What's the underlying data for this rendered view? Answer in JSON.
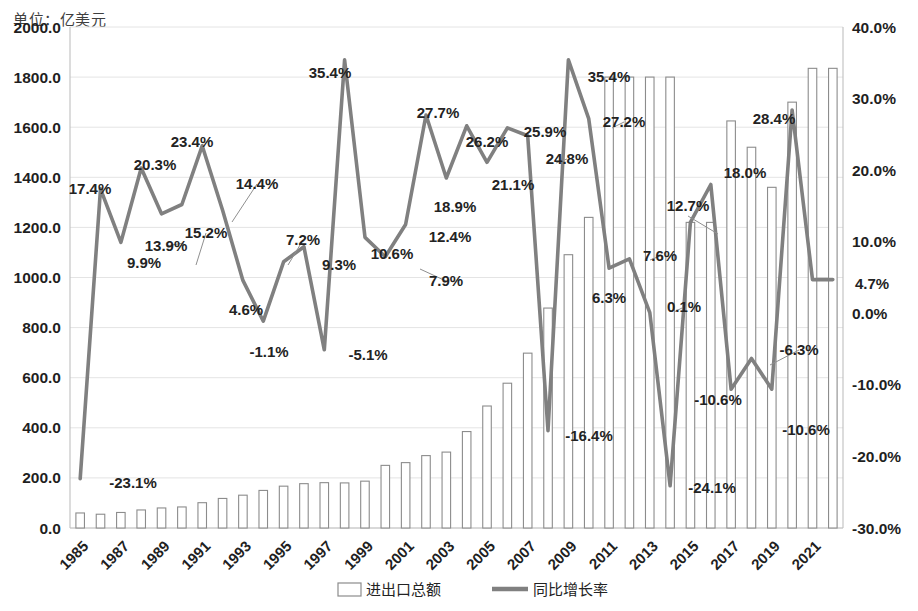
{
  "unit_note": "单位：亿美元",
  "legend": {
    "bar_label": "进出口总额",
    "line_label": "同比增长率"
  },
  "axes": {
    "left_ticks": [
      "0.0",
      "200.0",
      "400.0",
      "600.0",
      "800.0",
      "1000.0",
      "1200.0",
      "1400.0",
      "1600.0",
      "1800.0",
      "2000.0"
    ],
    "right_ticks": [
      "-30.0%",
      "-20.0%",
      "-10.0%",
      "0.0%",
      "10.0%",
      "20.0%",
      "30.0%",
      "40.0%"
    ],
    "x_ticks": [
      "1985",
      "1987",
      "1989",
      "1991",
      "1993",
      "1995",
      "1997",
      "1999",
      "2001",
      "2003",
      "2005",
      "2007",
      "2009",
      "2011",
      "2013",
      "2015",
      "2017",
      "2019",
      "2021"
    ]
  },
  "colors": {
    "bar_fill": "#ffffff",
    "bar_stroke": "#8c8c8c",
    "line": "#808080",
    "grid": "#e4e4e4",
    "text": "#232323"
  },
  "chart_data": {
    "type": "bar",
    "title": "",
    "subtitle": "",
    "xlabel": "",
    "ylabel": "亿美元",
    "y2label": "%",
    "ylim": [
      0,
      2000
    ],
    "y2lim": [
      -30,
      40
    ],
    "grid": true,
    "legend_position": "bottom",
    "categories": [
      "1985",
      "1986",
      "1987",
      "1988",
      "1989",
      "1990",
      "1991",
      "1992",
      "1993",
      "1994",
      "1995",
      "1996",
      "1997",
      "1998",
      "1999",
      "2000",
      "2001",
      "2002",
      "2003",
      "2004",
      "2005",
      "2006",
      "2007",
      "2008",
      "2009",
      "2010",
      "2011",
      "2012",
      "2013",
      "2014",
      "2015",
      "2016",
      "2017",
      "2018",
      "2019",
      "2020",
      "2021",
      "2022"
    ],
    "series": [
      {
        "name": "进出口总额",
        "type": "bar",
        "axis": "left",
        "unit": "亿美元",
        "values": [
          60,
          55,
          62,
          72,
          80,
          84,
          101,
          118,
          131,
          150,
          167,
          177,
          181,
          180,
          187,
          250,
          261,
          289,
          303,
          385,
          487,
          578,
          698,
          878,
          1091,
          1240,
          1800,
          1800,
          1800,
          1800,
          1220,
          1220,
          1625,
          1520,
          1360,
          1700,
          1835,
          1835
        ]
      },
      {
        "name": "同比增长率",
        "type": "line",
        "axis": "right",
        "unit": "%",
        "values": [
          -23.1,
          17.4,
          9.9,
          20.3,
          13.9,
          15.2,
          23.4,
          14.4,
          4.6,
          -1.1,
          7.2,
          9.3,
          -5.1,
          35.4,
          10.6,
          7.9,
          12.4,
          27.7,
          18.9,
          26.2,
          21.1,
          25.9,
          24.8,
          -16.4,
          35.4,
          27.2,
          6.3,
          7.6,
          0.1,
          -24.1,
          12.7,
          18.0,
          -10.6,
          -6.3,
          -10.6,
          28.4,
          4.7,
          4.7
        ],
        "labels": [
          "-23.1%",
          "17.4%",
          "9.9%",
          "20.3%",
          "13.9%",
          "15.2%",
          "23.4%",
          "14.4%",
          "4.6%",
          "-1.1%",
          "7.2%",
          "9.3%",
          "-5.1%",
          "35.4%",
          "10.6%",
          "7.9%",
          "12.4%",
          "27.7%",
          "18.9%",
          "26.2%",
          "21.1%",
          "25.9%",
          "24.8%",
          "-16.4%",
          "35.4%",
          "27.2%",
          "6.3%",
          "7.6%",
          "0.1%",
          "-24.1%",
          "12.7%",
          "18.0%",
          "-10.6%",
          "-6.3%",
          "-10.6%",
          "28.4%",
          "4.7%",
          "4.7%"
        ]
      }
    ],
    "data_labels": [
      {
        "text": "-23.1%",
        "x": 133,
        "y": 488
      },
      {
        "text": "17.4%",
        "x": 90,
        "y": 194
      },
      {
        "text": "9.9%",
        "x": 144,
        "y": 268
      },
      {
        "text": "20.3%",
        "x": 155,
        "y": 170
      },
      {
        "text": "13.9%",
        "x": 166,
        "y": 251
      },
      {
        "text": "15.2%",
        "x": 206,
        "y": 238
      },
      {
        "text": "23.4%",
        "x": 192,
        "y": 147
      },
      {
        "text": "14.4%",
        "x": 257,
        "y": 189
      },
      {
        "text": "4.6%",
        "x": 246,
        "y": 315
      },
      {
        "text": "-1.1%",
        "x": 269,
        "y": 357
      },
      {
        "text": "7.2%",
        "x": 303,
        "y": 245
      },
      {
        "text": "9.3%",
        "x": 339,
        "y": 270
      },
      {
        "text": "-5.1%",
        "x": 368,
        "y": 360
      },
      {
        "text": "35.4%",
        "x": 330,
        "y": 78
      },
      {
        "text": "10.6%",
        "x": 392,
        "y": 259
      },
      {
        "text": "7.9%",
        "x": 446,
        "y": 286
      },
      {
        "text": "12.4%",
        "x": 450,
        "y": 242
      },
      {
        "text": "27.7%",
        "x": 438,
        "y": 118
      },
      {
        "text": "18.9%",
        "x": 455,
        "y": 212
      },
      {
        "text": "26.2%",
        "x": 487,
        "y": 147
      },
      {
        "text": "21.1%",
        "x": 513,
        "y": 190
      },
      {
        "text": "25.9%",
        "x": 545,
        "y": 137
      },
      {
        "text": "24.8%",
        "x": 567,
        "y": 164
      },
      {
        "text": "-16.4%",
        "x": 589,
        "y": 441
      },
      {
        "text": "35.4%",
        "x": 609,
        "y": 82
      },
      {
        "text": "27.2%",
        "x": 624,
        "y": 127
      },
      {
        "text": "6.3%",
        "x": 609,
        "y": 303
      },
      {
        "text": "7.6%",
        "x": 660,
        "y": 261
      },
      {
        "text": "0.1%",
        "x": 684,
        "y": 312
      },
      {
        "text": "-24.1%",
        "x": 712,
        "y": 493
      },
      {
        "text": "12.7%",
        "x": 688,
        "y": 211
      },
      {
        "text": "18.0%",
        "x": 745,
        "y": 178
      },
      {
        "text": "-10.6%",
        "x": 718,
        "y": 405
      },
      {
        "text": "28.4%",
        "x": 774,
        "y": 124
      },
      {
        "text": "-6.3%",
        "x": 799,
        "y": 355
      },
      {
        "text": "-10.6%",
        "x": 806,
        "y": 435
      },
      {
        "text": "4.7%",
        "x": 872,
        "y": 289
      }
    ]
  }
}
